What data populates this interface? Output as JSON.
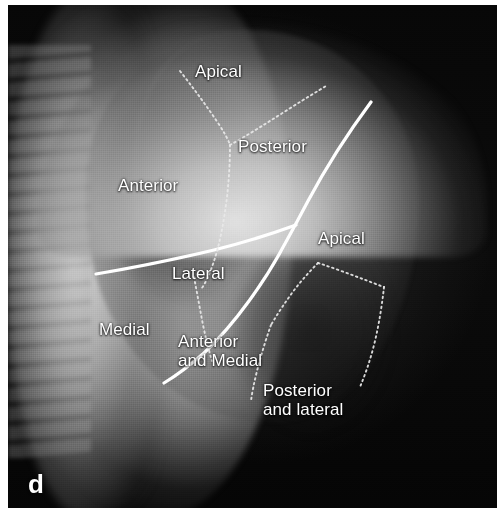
{
  "figure": {
    "letter": "d",
    "modality": "lateral chest radiograph"
  },
  "colors": {
    "label_text": "#ffffff",
    "solid_fissure_line": "#ffffff",
    "dotted_segment_line": "#e8e8e8",
    "film_background": "#0a0a0a",
    "page_background": "#ffffff"
  },
  "labels": [
    {
      "id": "apical-upper",
      "text": "Apical",
      "x": 195,
      "y": 62,
      "lines": 1
    },
    {
      "id": "posterior-upper",
      "text": "Posterior",
      "x": 238,
      "y": 137,
      "lines": 1
    },
    {
      "id": "anterior-upper",
      "text": "Anterior",
      "x": 118,
      "y": 176,
      "lines": 1
    },
    {
      "id": "apical-lower",
      "text": "Apical",
      "x": 318,
      "y": 229,
      "lines": 1
    },
    {
      "id": "lateral-middle",
      "text": "Lateral",
      "x": 172,
      "y": 264,
      "lines": 1
    },
    {
      "id": "medial-middle",
      "text": "Medial",
      "x": 99,
      "y": 320,
      "lines": 1
    },
    {
      "id": "anterior-and-medial",
      "text": "Anterior\nand Medial",
      "x": 178,
      "y": 332,
      "lines": 2
    },
    {
      "id": "posterior-and-lateral",
      "text": "Posterior\nand lateral",
      "x": 263,
      "y": 381,
      "lines": 2
    }
  ],
  "solid_fissures": [
    {
      "id": "oblique-fissure-major",
      "path": "M 363 97 C 340 128, 316 166, 300 196 C 291 213, 283 228, 274 244 C 258 274, 228 318, 196 348 C 180 362, 166 372, 156 378"
    },
    {
      "id": "horizontal-fissure-minor",
      "path": "M 88 269 C 124 263, 164 255, 206 245 C 238 237, 266 228, 288 220"
    }
  ],
  "dotted_segment_lines": [
    {
      "id": "upper-lobe-apical-anterior-divider",
      "path": "M 172 66 C 186 84, 198 100, 210 118 C 216 127, 220 134, 222 140"
    },
    {
      "id": "upper-lobe-apical-posterior-divider",
      "path": "M 222 140 C 240 130, 262 116, 284 102 C 298 93, 310 86, 318 81"
    },
    {
      "id": "anterior-lateral-segment-divider",
      "path": "M 222 140 C 222 156, 221 174, 219 192 C 216 216, 212 238, 206 256 C 202 268, 198 277, 194 283"
    },
    {
      "id": "lateral-medial-divider",
      "path": "M 186 272 C 189 288, 192 304, 195 320 C 198 334, 201 346, 204 356"
    },
    {
      "id": "lower-lobe-apical-posterior-divider",
      "path": "M 310 258 C 326 263, 344 270, 360 276 C 368 279, 373 281, 376 282"
    },
    {
      "id": "lower-lobe-apical-anterior-divider",
      "path": "M 310 258 C 302 266, 294 275, 287 284 C 278 296, 270 308, 263 320"
    },
    {
      "id": "lower-lobe-posterior-lateral-divider",
      "path": "M 376 282 C 374 300, 371 320, 366 340 C 362 356, 357 370, 352 382"
    },
    {
      "id": "lower-lobe-medial-divider",
      "path": "M 263 320 C 258 334, 253 350, 249 366 C 246 378, 244 388, 243 396"
    }
  ]
}
